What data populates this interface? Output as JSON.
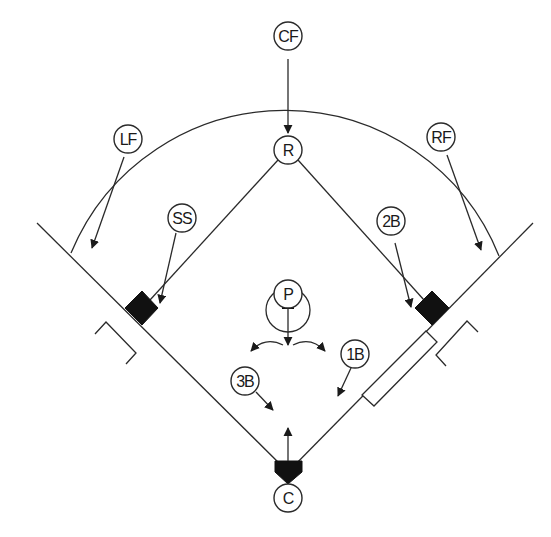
{
  "diagram": {
    "colors": {
      "line": "#2a2a2a",
      "base": "#111111",
      "background": "#ffffff"
    },
    "positions": [
      {
        "id": "cf",
        "label": "CF",
        "name": "Center Fielder"
      },
      {
        "id": "r",
        "label": "R",
        "name": "Runner"
      },
      {
        "id": "lf",
        "label": "LF",
        "name": "Left Fielder"
      },
      {
        "id": "rf",
        "label": "RF",
        "name": "Right Fielder"
      },
      {
        "id": "ss",
        "label": "SS",
        "name": "Shortstop"
      },
      {
        "id": "2b",
        "label": "2B",
        "name": "Second Baseman"
      },
      {
        "id": "p",
        "label": "P",
        "name": "Pitcher"
      },
      {
        "id": "1b",
        "label": "1B",
        "name": "First Baseman"
      },
      {
        "id": "3b",
        "label": "3B",
        "name": "Third Baseman"
      },
      {
        "id": "c",
        "label": "C",
        "name": "Catcher"
      }
    ]
  }
}
